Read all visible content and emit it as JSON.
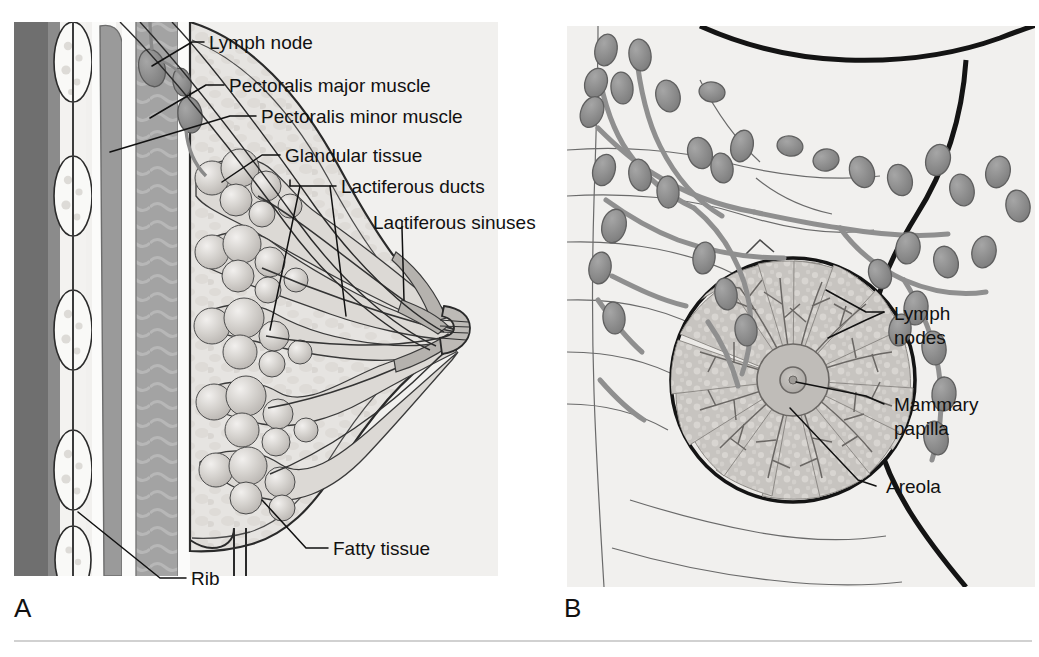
{
  "figure": {
    "panels": [
      {
        "id": "A",
        "letter": "A",
        "view": "Sagittal (lateral cross-section) view of the breast and chest wall",
        "labels": [
          {
            "key": "lymph_node",
            "text": "Lymph node"
          },
          {
            "key": "pectoralis_major",
            "text": "Pectoralis major muscle"
          },
          {
            "key": "pectoralis_minor",
            "text": "Pectoralis minor muscle"
          },
          {
            "key": "glandular_tissue",
            "text": "Glandular tissue"
          },
          {
            "key": "lactiferous_ducts",
            "text": "Lactiferous ducts"
          },
          {
            "key": "lactiferous_sinuses",
            "text": "Lactiferous sinuses"
          },
          {
            "key": "fatty_tissue",
            "text": "Fatty tissue"
          },
          {
            "key": "rib",
            "text": "Rib"
          }
        ]
      },
      {
        "id": "B",
        "letter": "B",
        "view": "Anterior view of the breast showing lymphatic drainage and glandular lobes",
        "labels": [
          {
            "key": "lymph_nodes",
            "text_line1": "Lymph",
            "text_line2": "nodes",
            "text": "Lymph nodes"
          },
          {
            "key": "mammary_papilla",
            "text_line1": "Mammary",
            "text_line2": "papilla",
            "text": "Mammary papilla"
          },
          {
            "key": "areola",
            "text_line1": "Areola",
            "text_line2": "",
            "text": "Areola"
          }
        ]
      }
    ],
    "caption_rule": true
  },
  "colors": {
    "page_background": "#ffffff",
    "panel_background": "#f0f0ee",
    "skin_outline": "#1a1a1a",
    "fatty_tissue": "#e3e1de",
    "glandular_tissue": "#c9c6c2",
    "lobule_fill": "#cfccc8",
    "muscle_dark": "#8e8e8e",
    "muscle_mid": "#a8a8a8",
    "deep_shadow": "#6e6e6e",
    "rib_fill": "#f7f7f5",
    "lymph_node_fill": "#8f8f8f",
    "lymph_vessel": "#9a9a9a",
    "duct_line": "#3a3a3a",
    "label_text": "#111111",
    "leader_line": "#111111",
    "caption_rule": "#bdbdbd"
  }
}
